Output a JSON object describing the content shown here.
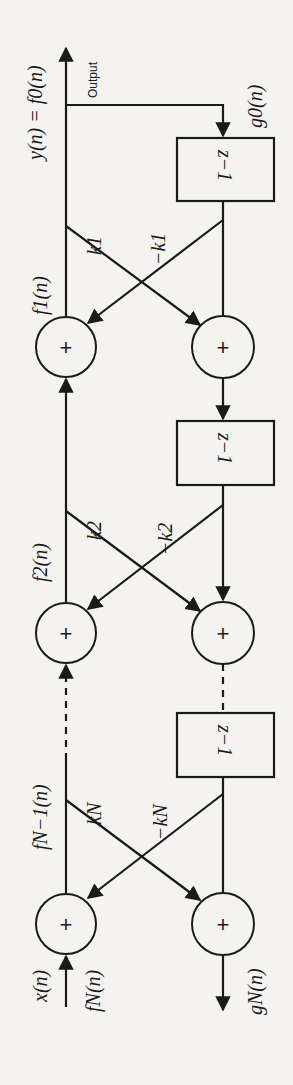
{
  "diagram": {
    "type": "lattice-filter",
    "orientation": "rotated-90-clockwise",
    "labels": {
      "output_eq": "y(n) = f0(n)",
      "output_text": "Output",
      "g0": "g0(n)",
      "f1": "f1(n)",
      "f2": "f2(n)",
      "fN1": "fN−1(n)",
      "xn": "x(n)",
      "fN": "fN(n)",
      "gN": "gN(n)"
    },
    "stages": [
      {
        "k": "k1",
        "neg_k": "−k1",
        "delay": "z−1"
      },
      {
        "k": "k2",
        "neg_k": "−k2",
        "delay": "z−1"
      },
      {
        "k": "kN",
        "neg_k": "−kN",
        "delay": "z−1"
      }
    ],
    "adder_symbol": "+"
  }
}
